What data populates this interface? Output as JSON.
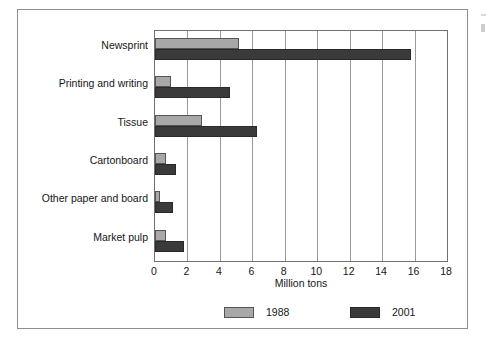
{
  "chart_data": {
    "type": "bar",
    "orientation": "horizontal",
    "title": "",
    "xlabel": "Million tons",
    "ylabel": "",
    "xlim": [
      0,
      18
    ],
    "xticks": [
      0,
      2,
      4,
      6,
      8,
      10,
      12,
      14,
      16,
      18
    ],
    "grid": true,
    "legend_position": "bottom",
    "categories": [
      "Newsprint",
      "Printing and writing",
      "Tissue",
      "Cartonboard",
      "Other paper and board",
      "Market pulp"
    ],
    "series": [
      {
        "name": "1988",
        "color": "#a8a8a8",
        "values": [
          5.2,
          1.0,
          2.9,
          0.7,
          0.3,
          0.7
        ]
      },
      {
        "name": "2001",
        "color": "#3a3a3a",
        "values": [
          15.8,
          4.6,
          6.3,
          1.3,
          1.1,
          1.8
        ]
      }
    ]
  }
}
